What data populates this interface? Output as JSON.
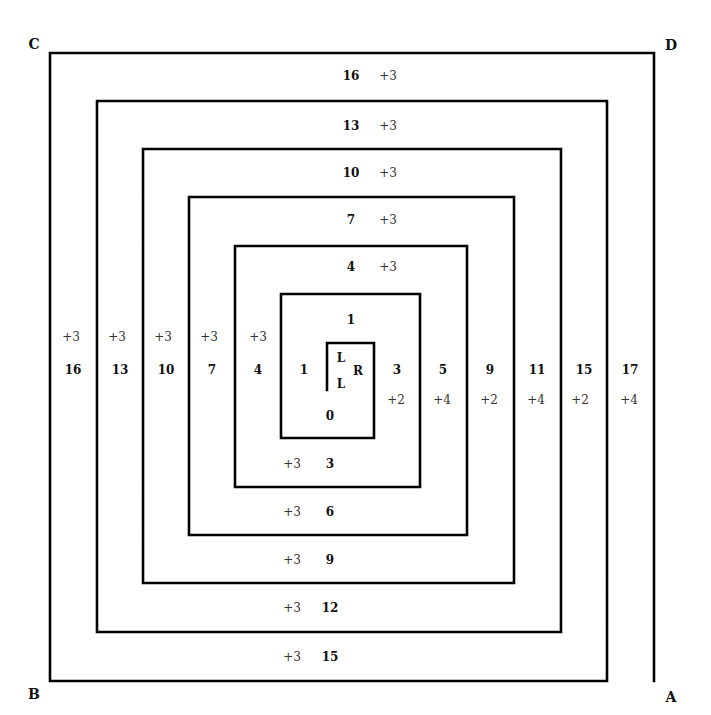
{
  "corners": {
    "C": {
      "label": "C",
      "x": 34,
      "y": 49
    },
    "D": {
      "label": "D",
      "x": 671,
      "y": 50
    },
    "B": {
      "label": "B",
      "x": 34,
      "y": 699
    },
    "A": {
      "label": "A",
      "x": 671,
      "y": 702
    }
  },
  "spiral": {
    "points": [
      [
        327,
        390
      ],
      [
        327,
        343
      ],
      [
        374,
        343
      ],
      [
        374,
        438
      ],
      [
        281,
        438
      ],
      [
        281,
        294
      ],
      [
        420,
        294
      ],
      [
        420,
        487
      ],
      [
        235,
        487
      ],
      [
        235,
        246
      ],
      [
        467,
        246
      ],
      [
        467,
        535
      ],
      [
        189,
        535
      ],
      [
        189,
        197
      ],
      [
        514,
        197
      ],
      [
        514,
        583
      ],
      [
        143,
        583
      ],
      [
        143,
        149
      ],
      [
        561,
        149
      ],
      [
        561,
        632
      ],
      [
        97,
        632
      ],
      [
        97,
        101
      ],
      [
        607,
        101
      ],
      [
        607,
        681
      ],
      [
        50,
        681
      ],
      [
        50,
        53
      ],
      [
        654,
        53
      ],
      [
        654,
        681
      ]
    ]
  },
  "center": {
    "L_top": "L",
    "R": "R",
    "L_bottom": "L",
    "top": "1",
    "left": "1",
    "bottom": "0"
  },
  "top_labels": [
    {
      "num": "16",
      "inc": "+3",
      "y": 80
    },
    {
      "num": "13",
      "inc": "+3",
      "y": 130
    },
    {
      "num": "10",
      "inc": "+3",
      "y": 177
    },
    {
      "num": "7",
      "inc": "+3",
      "y": 224
    },
    {
      "num": "4",
      "inc": "+3",
      "y": 271
    }
  ],
  "bottom_labels": [
    {
      "inc": "+3",
      "num": "3",
      "y": 468
    },
    {
      "inc": "+3",
      "num": "6",
      "y": 516
    },
    {
      "inc": "+3",
      "num": "9",
      "y": 564
    },
    {
      "inc": "+3",
      "num": "12",
      "y": 612
    },
    {
      "inc": "+3",
      "num": "15",
      "y": 661
    }
  ],
  "left_labels": [
    {
      "inc": "+3",
      "num": "16",
      "x": 72
    },
    {
      "inc": "+3",
      "num": "13",
      "x": 119
    },
    {
      "inc": "+3",
      "num": "10",
      "x": 166
    },
    {
      "inc": "+3",
      "num": "7",
      "x": 212
    },
    {
      "inc": "+3",
      "num": "4",
      "x": 258
    }
  ],
  "right_labels": [
    {
      "num": "3",
      "inc": "+2",
      "x": 397
    },
    {
      "num": "5",
      "inc": "+4",
      "x": 443
    },
    {
      "num": "9",
      "inc": "+2",
      "x": 490
    },
    {
      "num": "11",
      "inc": "+4",
      "x": 537
    },
    {
      "num": "15",
      "inc": "+2",
      "x": 583
    },
    {
      "num": "17",
      "inc": "+4",
      "x": 630
    }
  ]
}
